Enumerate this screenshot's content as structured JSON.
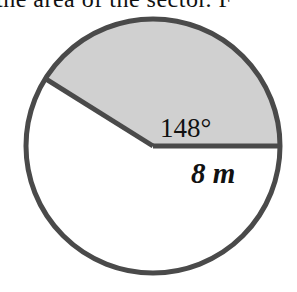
{
  "header": {
    "cropped_text": "the area of the sector. F"
  },
  "figure": {
    "type": "circle-sector",
    "angle_label": "148°",
    "radius_label": "8 m",
    "sector_angle_deg": 148,
    "radius_value": 8,
    "radius_unit": "m",
    "colors": {
      "sector_fill": "#d0d0d0",
      "circle_fill": "#ffffff",
      "stroke": "#4a4a4a",
      "text": "#111111"
    }
  }
}
